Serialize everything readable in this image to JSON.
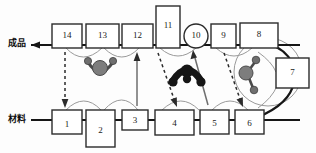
{
  "diagram": {
    "title": "",
    "rails": [
      {
        "id": "finished",
        "label": "成品",
        "label_x": 8,
        "label_y": 36,
        "y": 45,
        "x1": 30,
        "x2": 300,
        "direction": "left"
      },
      {
        "id": "material",
        "label": "材料",
        "label_x": 8,
        "label_y": 112,
        "y": 120,
        "x1": 30,
        "x2": 300,
        "direction": "right"
      }
    ],
    "nodes": [
      {
        "id": "n14",
        "label": "14",
        "shape": "rect",
        "x": 52,
        "y": 24,
        "w": 30,
        "h": 24
      },
      {
        "id": "n13",
        "label": "13",
        "shape": "rect",
        "x": 86,
        "y": 24,
        "w": 33,
        "h": 24
      },
      {
        "id": "n12",
        "label": "12",
        "shape": "rect",
        "x": 122,
        "y": 24,
        "w": 31,
        "h": 24
      },
      {
        "id": "n11",
        "label": "11",
        "shape": "rect",
        "x": 156,
        "y": 6,
        "w": 24,
        "h": 42
      },
      {
        "id": "n10",
        "label": "10",
        "shape": "circle",
        "x": 184,
        "y": 24,
        "w": 24,
        "h": 24
      },
      {
        "id": "n9",
        "label": "9",
        "shape": "rect",
        "x": 211,
        "y": 24,
        "w": 25,
        "h": 24
      },
      {
        "id": "n8",
        "label": "8",
        "shape": "rect",
        "x": 240,
        "y": 23,
        "w": 38,
        "h": 25
      },
      {
        "id": "n7",
        "label": "7",
        "shape": "rect",
        "x": 276,
        "y": 58,
        "w": 33,
        "h": 30
      },
      {
        "id": "n1",
        "label": "1",
        "shape": "rect",
        "x": 52,
        "y": 110,
        "w": 30,
        "h": 24
      },
      {
        "id": "n2",
        "label": "2",
        "shape": "rect",
        "x": 86,
        "y": 110,
        "w": 29,
        "h": 37
      },
      {
        "id": "n3",
        "label": "3",
        "shape": "rect",
        "x": 122,
        "y": 110,
        "w": 26,
        "h": 20
      },
      {
        "id": "n4",
        "label": "4",
        "shape": "rect",
        "x": 155,
        "y": 110,
        "w": 39,
        "h": 25
      },
      {
        "id": "n5",
        "label": "5",
        "shape": "rect",
        "x": 200,
        "y": 110,
        "w": 29,
        "h": 24
      },
      {
        "id": "n6",
        "label": "6",
        "shape": "rect",
        "x": 235,
        "y": 110,
        "w": 29,
        "h": 24
      }
    ],
    "connectors": [
      {
        "id": "c14-1",
        "from": "n14",
        "to": "n1",
        "style": "dashed",
        "arrow": "down"
      },
      {
        "id": "c3-12",
        "from": "n3",
        "to": "n12",
        "style": "solid",
        "arrow": "up"
      },
      {
        "id": "c11-4",
        "from": "n11",
        "to": "n4",
        "style": "dashed",
        "arrow": "down"
      },
      {
        "id": "c5-10",
        "from": "n5",
        "to": "n10",
        "style": "solid",
        "arrow": "up"
      },
      {
        "id": "c9-6",
        "from": "n9",
        "to": "n6",
        "style": "dashed",
        "arrow": "down"
      },
      {
        "id": "c8-7-6",
        "from": "n8",
        "to": "n6",
        "style": "curve",
        "arrow": "none"
      }
    ],
    "molecules": [
      {
        "id": "m-gray-left",
        "color": "#7d7d7d",
        "cx": 100,
        "cy": 68
      },
      {
        "id": "m-dark-mid",
        "color": "#161616",
        "cx": 187,
        "cy": 75
      },
      {
        "id": "m-gray-right",
        "color": "#7d7d7d",
        "cx": 248,
        "cy": 74
      }
    ],
    "colors": {
      "stroke": "#2b2b2b",
      "rail": "#161616",
      "arc": "#9a9a9a",
      "molecule_gray": "#7d7d7d",
      "molecule_dark": "#161616",
      "background": "#fdfdfd"
    }
  }
}
